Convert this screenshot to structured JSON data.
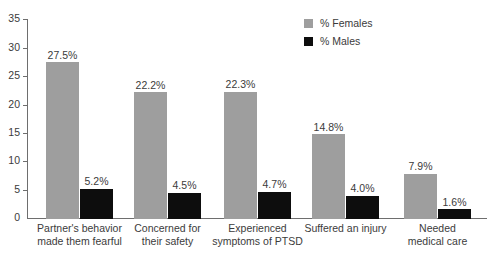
{
  "chart_data": {
    "type": "bar",
    "title": "",
    "subtitle": "",
    "xlabel": "",
    "ylabel": "",
    "ylim": [
      0,
      35
    ],
    "yticks": [
      0,
      5,
      10,
      15,
      20,
      25,
      30,
      35
    ],
    "ytick_labels": [
      "0",
      "5",
      "10",
      "15",
      "20",
      "25",
      "30",
      "35"
    ],
    "grid": false,
    "legend_position": "top-right",
    "categories": [
      "Partner's behavior made them fearful",
      "Concerned for their safety",
      "Experienced symptoms of PTSD",
      "Suffered an injury",
      "Needed medical care"
    ],
    "category_lines": [
      [
        "Partner's behavior",
        "made them fearful"
      ],
      [
        "Concerned for",
        "their safety"
      ],
      [
        "Experienced",
        "symptoms of PTSD"
      ],
      [
        "Suffered an injury",
        ""
      ],
      [
        "Needed",
        "medical care"
      ]
    ],
    "series": [
      {
        "name": "% Females",
        "color": "#9e9e9e",
        "values": [
          27.5,
          22.2,
          22.3,
          14.8,
          7.9
        ],
        "labels": [
          "27.5%",
          "22.2%",
          "22.3%",
          "14.8%",
          "7.9%"
        ]
      },
      {
        "name": "% Males",
        "color": "#0d0d0d",
        "values": [
          5.2,
          4.5,
          4.7,
          4.0,
          1.6
        ],
        "labels": [
          "5.2%",
          "4.5%",
          "4.7%",
          "4.0%",
          "1.6%"
        ]
      }
    ]
  },
  "legend": {
    "items": [
      {
        "label": "% Females",
        "swatch": "legend-swatch-females"
      },
      {
        "label": "% Males",
        "swatch": "legend-swatch-males"
      }
    ]
  },
  "colors": {
    "females": "#9e9e9e",
    "males": "#0d0d0d",
    "axis": "#6e6e6e",
    "text": "#3b3b3b",
    "background": "#ffffff"
  }
}
